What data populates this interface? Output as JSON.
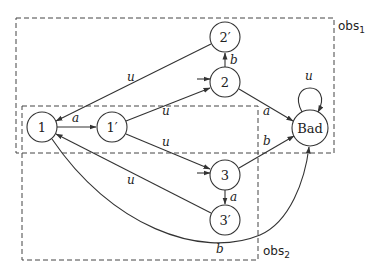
{
  "diagram": {
    "type": "state-transition-graph",
    "nodes": [
      {
        "id": "1",
        "label": "1",
        "cx": 42,
        "cy": 127,
        "r": 15,
        "initial": false
      },
      {
        "id": "1p",
        "label": "1′",
        "cx": 112,
        "cy": 127,
        "r": 15,
        "initial": false
      },
      {
        "id": "2p",
        "label": "2′",
        "cx": 225,
        "cy": 37,
        "r": 15,
        "initial": false
      },
      {
        "id": "2",
        "label": "2",
        "cx": 225,
        "cy": 82,
        "r": 15,
        "initial": true
      },
      {
        "id": "bad",
        "label": "Bad",
        "cx": 310,
        "cy": 128,
        "r": 18,
        "initial": false
      },
      {
        "id": "3",
        "label": "3",
        "cx": 225,
        "cy": 175,
        "r": 15,
        "initial": true
      },
      {
        "id": "3p",
        "label": "3′",
        "cx": 225,
        "cy": 220,
        "r": 15,
        "initial": false
      }
    ],
    "edges": [
      {
        "from": "1",
        "to": "1p",
        "label": "a"
      },
      {
        "from": "1p",
        "to": "2",
        "label": "u"
      },
      {
        "from": "1p",
        "to": "3",
        "label": "u"
      },
      {
        "from": "2p",
        "to": "1",
        "label": "u"
      },
      {
        "from": "2",
        "to": "2p",
        "label": "b"
      },
      {
        "from": "2",
        "to": "bad",
        "label": "a"
      },
      {
        "from": "3",
        "to": "bad",
        "label": "b"
      },
      {
        "from": "3",
        "to": "3p",
        "label": "a"
      },
      {
        "from": "3p",
        "to": "1",
        "label": "u"
      },
      {
        "from": "1",
        "to": "bad",
        "label": "b"
      },
      {
        "from": "bad",
        "to": "bad",
        "label": "u"
      }
    ],
    "observation_sets": [
      {
        "id": "obs1",
        "label": "obs",
        "subscript": "1",
        "members": [
          "1",
          "1p",
          "2",
          "2p",
          "bad"
        ]
      },
      {
        "id": "obs2",
        "label": "obs",
        "subscript": "2",
        "members": [
          "1",
          "1p",
          "3",
          "3p"
        ]
      }
    ]
  },
  "labels": {
    "n1": "1",
    "n1p": "1′",
    "n2p": "2′",
    "n2": "2",
    "nbad": "Bad",
    "n3": "3",
    "n3p": "3′",
    "e_1_1p": "a",
    "e_1p_2": "u",
    "e_1p_3": "u",
    "e_2p_1": "u",
    "e_2_2p": "b",
    "e_2_bad": "a",
    "e_3_bad": "b",
    "e_3_3p": "a",
    "e_3p_1": "u",
    "e_1_bad": "b",
    "e_bad_bad": "u",
    "obs1": "obs",
    "obs1_sub": "1",
    "obs2": "obs",
    "obs2_sub": "2"
  }
}
